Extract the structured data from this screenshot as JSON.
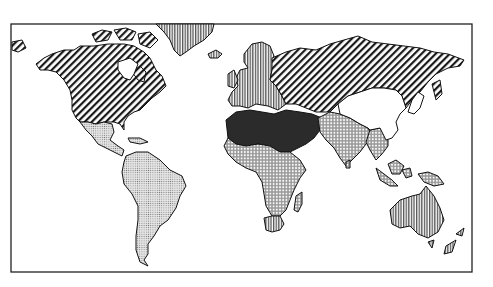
{
  "map": {
    "type": "world-choropleth",
    "style": "black-and-white patterned",
    "frame": {
      "x": 11,
      "y": 24,
      "width": 461,
      "height": 248
    },
    "categories": [
      {
        "id": "diag",
        "pattern": "diagonal-hatch",
        "regions": [
          "Alaska",
          "Canada",
          "United States",
          "Soviet Union"
        ]
      },
      {
        "id": "vert",
        "pattern": "vertical-lines",
        "regions": [
          "Greenland",
          "Iceland",
          "Europe",
          "South Africa",
          "Australia",
          "New Zealand"
        ]
      },
      {
        "id": "solid",
        "pattern": "solid-dark",
        "regions": [
          "North Africa",
          "Middle East"
        ]
      },
      {
        "id": "coarse",
        "pattern": "coarse-crosshatch-dots",
        "regions": [
          "Sub-Saharan Africa",
          "South Asia",
          "Southeast Asia",
          "Indonesia",
          "Madagascar"
        ]
      },
      {
        "id": "fine",
        "pattern": "fine-stipple",
        "regions": [
          "Mexico",
          "Central America",
          "South America"
        ]
      },
      {
        "id": "blank",
        "pattern": "white",
        "regions": [
          "China",
          "Mongolia",
          "Korea",
          "Japan"
        ]
      }
    ],
    "colors": {
      "ink": "#1a1a1a",
      "paper": "#ffffff",
      "solid": "#2b2b2b"
    }
  }
}
